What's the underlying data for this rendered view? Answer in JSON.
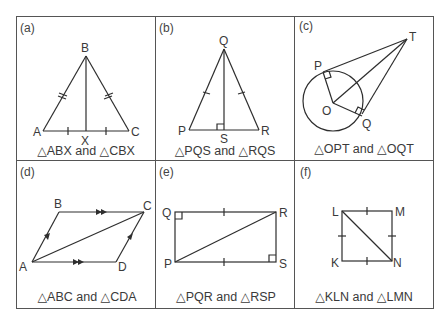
{
  "figure": {
    "panels": [
      {
        "tag": "(a)",
        "caption": "△ABX and △CBX",
        "points": {
          "A": "A",
          "B": "B",
          "C": "C",
          "X": "X"
        }
      },
      {
        "tag": "(b)",
        "caption": "△PQS and △RQS",
        "points": {
          "P": "P",
          "Q": "Q",
          "R": "R",
          "S": "S"
        }
      },
      {
        "tag": "(c)",
        "caption": "△OPT and △OQT",
        "points": {
          "O": "O",
          "P": "P",
          "Q": "Q",
          "T": "T"
        }
      },
      {
        "tag": "(d)",
        "caption": "△ABC and △CDA",
        "points": {
          "A": "A",
          "B": "B",
          "C": "C",
          "D": "D"
        }
      },
      {
        "tag": "(e)",
        "caption": "△PQR and △RSP",
        "points": {
          "P": "P",
          "Q": "Q",
          "R": "R",
          "S": "S"
        }
      },
      {
        "tag": "(f)",
        "caption": "△KLN and △LMN",
        "points": {
          "K": "K",
          "L": "L",
          "M": "M",
          "N": "N"
        }
      }
    ]
  },
  "colors": {
    "line": "#2e2e2e",
    "text": "#3a3a3a",
    "background": "#ffffff"
  }
}
